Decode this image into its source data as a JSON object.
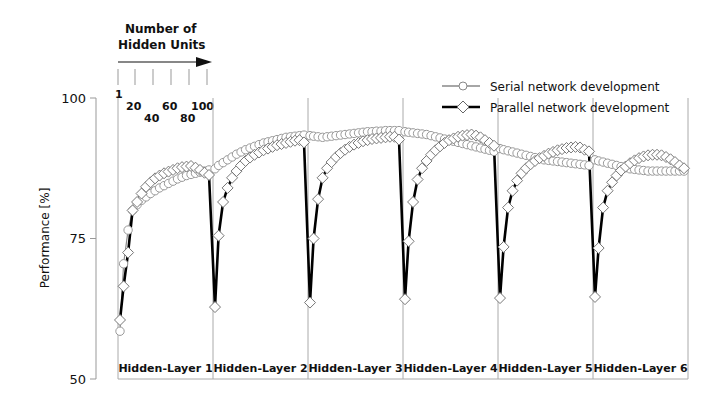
{
  "chart_data": {
    "type": "line",
    "title": "",
    "xlabel": "",
    "ylabel": "Performance [%]",
    "ylim": [
      50,
      100
    ],
    "yticks": [
      50,
      75,
      100
    ],
    "x_annotation": {
      "title_line1": "Number of",
      "title_line2": "Hidden Units",
      "ticks": [
        "1",
        "20",
        "40",
        "60",
        "80",
        "100"
      ]
    },
    "layers": [
      "Hidden-Layer 1",
      "Hidden-Layer 2",
      "Hidden-Layer 3",
      "Hidden-Layer 4",
      "Hidden-Layer 5",
      "Hidden-Layer 6"
    ],
    "x_per_layer": [
      1,
      5,
      10,
      15,
      20,
      25,
      30,
      35,
      40,
      45,
      50,
      55,
      60,
      65,
      70,
      75,
      80,
      85,
      90,
      95,
      100
    ],
    "legend": {
      "position": "top-right",
      "entries": [
        "Serial network development",
        "Parallel network development"
      ]
    },
    "series": [
      {
        "name": "Serial network development",
        "marker": "circle",
        "color": "#8a8a8a",
        "values": [
          [
            58.5,
            70.5,
            76.5,
            80.0,
            81.0,
            81.8,
            82.4,
            83.0,
            83.5,
            84.0,
            84.4,
            84.8,
            85.2,
            85.6,
            85.9,
            86.2,
            86.4,
            86.6,
            86.8,
            87.0,
            87.2
          ],
          [
            87.4,
            88.0,
            88.5,
            89.0,
            89.5,
            90.0,
            90.4,
            90.8,
            91.1,
            91.4,
            91.7,
            92.0,
            92.2,
            92.4,
            92.6,
            92.8,
            93.0,
            93.1,
            93.2,
            93.3,
            93.4
          ],
          [
            93.3,
            93.2,
            93.1,
            93.0,
            93.1,
            93.2,
            93.3,
            93.4,
            93.5,
            93.6,
            93.7,
            93.8,
            93.9,
            94.0,
            94.0,
            94.1,
            94.1,
            94.2,
            94.2,
            94.2,
            94.2
          ],
          [
            94.0,
            93.9,
            93.8,
            93.7,
            93.6,
            93.5,
            93.3,
            93.1,
            92.9,
            92.7,
            92.5,
            92.3,
            92.1,
            91.9,
            91.7,
            91.5,
            91.3,
            91.1,
            90.9,
            90.7,
            90.5
          ],
          [
            91.0,
            90.8,
            90.6,
            90.4,
            90.2,
            90.0,
            89.8,
            89.6,
            89.4,
            89.2,
            89.0,
            88.9,
            88.8,
            88.7,
            88.6,
            88.5,
            88.4,
            88.3,
            88.2,
            88.1,
            88.0
          ],
          [
            89.0,
            88.8,
            88.6,
            88.4,
            88.2,
            88.0,
            87.8,
            87.6,
            87.4,
            87.3,
            87.2,
            87.1,
            87.0,
            87.0,
            87.0,
            87.0,
            87.0,
            87.0,
            87.0,
            87.0,
            87.0
          ]
        ]
      },
      {
        "name": "Parallel network development",
        "marker": "diamond",
        "color": "#000000",
        "values": [
          [
            60.5,
            66.5,
            72.5,
            80.0,
            81.5,
            83.0,
            84.2,
            85.0,
            85.7,
            86.2,
            86.6,
            86.9,
            87.2,
            87.5,
            87.7,
            87.8,
            87.9,
            87.6,
            87.2,
            86.7,
            86.3
          ],
          [
            62.8,
            75.5,
            81.5,
            84.0,
            85.8,
            87.0,
            88.0,
            88.8,
            89.4,
            89.9,
            90.3,
            90.7,
            91.0,
            91.3,
            91.6,
            91.8,
            92.0,
            92.2,
            92.4,
            92.5,
            92.1
          ],
          [
            63.6,
            75.0,
            82.0,
            85.8,
            87.5,
            88.6,
            89.5,
            90.2,
            90.8,
            91.3,
            91.7,
            92.0,
            92.3,
            92.5,
            92.7,
            92.8,
            92.9,
            93.0,
            93.1,
            93.1,
            92.6
          ],
          [
            64.2,
            74.5,
            81.5,
            85.5,
            87.5,
            88.8,
            89.9,
            90.7,
            91.4,
            92.0,
            92.5,
            92.8,
            93.1,
            93.3,
            93.4,
            93.5,
            93.3,
            93.0,
            92.5,
            92.0,
            91.5
          ],
          [
            64.4,
            73.5,
            80.5,
            83.5,
            85.3,
            86.6,
            87.5,
            88.2,
            88.8,
            89.3,
            89.7,
            90.1,
            90.4,
            90.7,
            90.9,
            91.1,
            91.2,
            91.3,
            91.2,
            90.8,
            90.5
          ],
          [
            64.6,
            73.3,
            80.5,
            83.5,
            85.0,
            86.2,
            87.1,
            87.8,
            88.4,
            88.9,
            89.3,
            89.6,
            89.8,
            89.9,
            89.9,
            89.8,
            89.5,
            89.1,
            88.6,
            88.0,
            87.5
          ]
        ]
      }
    ]
  }
}
